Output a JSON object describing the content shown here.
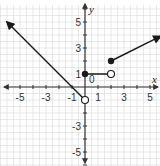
{
  "chart_data": {
    "type": "line",
    "title": "",
    "xlabel": "x",
    "ylabel": "y",
    "xlim": [
      -6.3,
      5.8
    ],
    "ylim": [
      -6,
      6.5
    ],
    "grid": true,
    "origin_label": "0",
    "x_ticks": [
      -5,
      -3,
      -1,
      1,
      3,
      5
    ],
    "y_ticks": [
      5,
      3,
      1,
      -3,
      -5
    ],
    "series": [
      {
        "name": "left ray",
        "description": "y = -x - 1 for x < 0",
        "points": [
          [
            -6,
            5
          ],
          [
            0,
            -1
          ]
        ],
        "start": {
          "x": -6,
          "y": 5,
          "marker": "arrow"
        },
        "end": {
          "x": 0,
          "y": -1,
          "marker": "open"
        }
      },
      {
        "name": "middle segment",
        "description": "y = 1 for 0 <= x < 2",
        "points": [
          [
            0,
            1
          ],
          [
            2,
            1
          ]
        ],
        "start": {
          "x": 0,
          "y": 1,
          "marker": "closed"
        },
        "end": {
          "x": 2,
          "y": 1,
          "marker": "open"
        }
      },
      {
        "name": "right ray",
        "description": "y = 0.5x + 1 for x >= 2",
        "points": [
          [
            2,
            2
          ],
          [
            5.8,
            3.9
          ]
        ],
        "start": {
          "x": 2,
          "y": 2,
          "marker": "closed"
        },
        "end": {
          "x": 5.8,
          "y": 3.9,
          "marker": "arrow"
        }
      }
    ]
  },
  "colors": {
    "grid": "#d9d9d9",
    "axis": "#333333",
    "line": "#1a1a1a"
  }
}
